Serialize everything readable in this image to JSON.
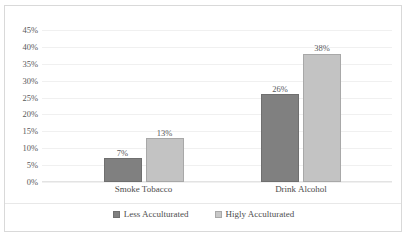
{
  "chart_data": {
    "type": "bar",
    "title": "",
    "xlabel": "",
    "ylabel": "",
    "categories": [
      "Smoke Tobacco",
      "Drink Alcohol"
    ],
    "series": [
      {
        "name": "Less Acculturated",
        "color": "#808080",
        "values": [
          7,
          26
        ],
        "labels": [
          "7%",
          "26%"
        ]
      },
      {
        "name": "Higly Acculturated",
        "color": "#c3c3c3",
        "values": [
          13,
          38
        ],
        "labels": [
          "13%",
          "38%"
        ]
      }
    ],
    "ylim": [
      0,
      45
    ],
    "ytick_values": [
      45,
      40,
      35,
      30,
      25,
      20,
      15,
      10,
      5,
      0
    ],
    "ytick_labels": [
      "45%",
      "40%",
      "35%",
      "30%",
      "25%",
      "20%",
      "15%",
      "10%",
      "5%",
      "0%"
    ],
    "grid": true,
    "legend_position": "bottom"
  },
  "legend": {
    "items": [
      {
        "label": "Less Acculturated"
      },
      {
        "label": "Higly Acculturated"
      }
    ]
  }
}
